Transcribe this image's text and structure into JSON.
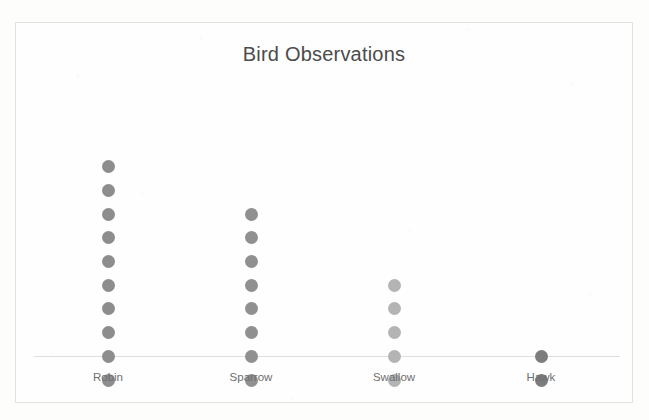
{
  "chart_data": {
    "type": "scatter",
    "title": "Bird Observations",
    "xlabel": "",
    "ylabel": "",
    "grid": false,
    "legend": "none",
    "plot_style": "dot-plot",
    "categories": [
      "Robin",
      "Sparrow",
      "Swallow",
      "Hawk"
    ],
    "values": [
      10,
      8,
      5,
      2
    ],
    "series": [
      {
        "name": "Observations",
        "values": [
          10,
          8,
          5,
          2
        ]
      }
    ],
    "points": [
      {
        "category": "Robin",
        "count": 10,
        "color": "#8d8d8d",
        "x_center": 107
      },
      {
        "category": "Sparrow",
        "count": 8,
        "color": "#909090",
        "x_center": 250
      },
      {
        "category": "Swallow",
        "count": 5,
        "color": "#b4b4b4",
        "x_center": 393
      },
      {
        "category": "Hawk",
        "count": 2,
        "color": "#7c7c7c",
        "x_center": 540
      }
    ],
    "ylim": [
      0,
      11
    ],
    "dot_spacing_px": 23.7,
    "dot_diameter_px": 13
  },
  "frame": {
    "border_color": "#e2e2e2",
    "background_color": "#fefefe",
    "axis_color": "#dedede"
  },
  "title_color": "#4b4b4b",
  "label_color": "#6f6f6f"
}
